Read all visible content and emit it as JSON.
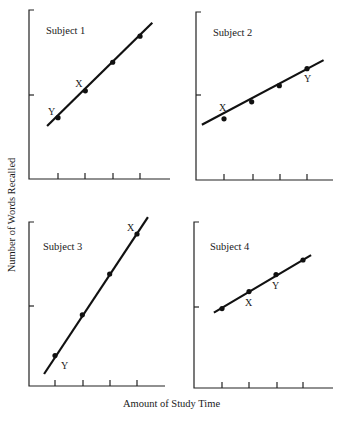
{
  "chart_data": {
    "type": "line",
    "title": "",
    "xlabel": "Amount of Study Time",
    "ylabel": "Number of Words Recalled",
    "grid": false,
    "legend": null,
    "note": "y-values normalized: 0 = x-axis, 1 = middle y tick, 2 = top of y-axis; x = tick index 1-4",
    "ylim": [
      0,
      2
    ],
    "xlim": [
      0,
      5
    ],
    "subplots": [
      {
        "title": "Subject 1",
        "x": [
          1,
          2,
          3,
          4
        ],
        "y": [
          0.73,
          1.05,
          1.39,
          1.7
        ],
        "annotations": [
          {
            "label": "Y",
            "point_index": 0
          },
          {
            "label": "X",
            "point_index": 1
          }
        ],
        "line_extent": {
          "x0": 0.6,
          "y0": 0.63,
          "x1": 4.45,
          "y1": 1.86
        }
      },
      {
        "title": "Subject 2",
        "x": [
          1,
          2,
          3,
          4
        ],
        "y": [
          0.72,
          0.92,
          1.11,
          1.31
        ],
        "annotations": [
          {
            "label": "X",
            "point_index": 0
          },
          {
            "label": "Y",
            "point_index": 3
          }
        ],
        "line_extent": {
          "x0": 0.2,
          "y0": 0.65,
          "x1": 4.6,
          "y1": 1.41
        }
      },
      {
        "title": "Subject 3",
        "x": [
          1,
          2,
          3,
          4
        ],
        "y": [
          0.38,
          0.89,
          1.4,
          1.9
        ],
        "annotations": [
          {
            "label": "Y",
            "point_index": 0
          },
          {
            "label": "X",
            "point_index": 3
          }
        ],
        "line_extent": {
          "x0": 0.6,
          "y0": 0.15,
          "x1": 4.4,
          "y1": 2.11
        }
      },
      {
        "title": "Subject 4",
        "x": [
          1,
          2,
          3,
          4
        ],
        "y": [
          0.98,
          1.19,
          1.4,
          1.58
        ],
        "annotations": [
          {
            "label": "X",
            "point_index": 1
          },
          {
            "label": "Y",
            "point_index": 2
          }
        ],
        "line_extent": {
          "x0": 0.7,
          "y0": 0.93,
          "x1": 4.3,
          "y1": 1.64
        }
      }
    ]
  },
  "labels": {
    "xlabel": "Amount of Study Time",
    "ylabel": "Number of Words Recalled"
  }
}
